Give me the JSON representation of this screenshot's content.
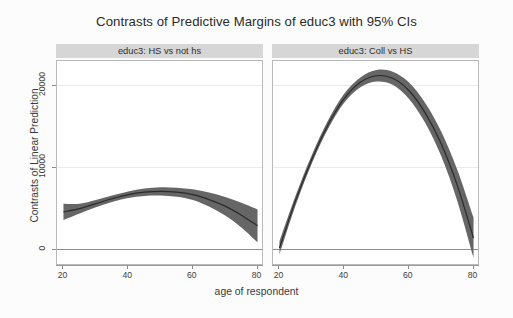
{
  "figure": {
    "title": "Contrasts of Predictive Margins of educ3 with 95% CIs",
    "xaxis_title": "age of respondent",
    "yaxis_title": "Contrasts of Linear Prediction",
    "background": "#fcfcfc",
    "panel_header_bg": "#d6d6d6",
    "plot_bg": "#ffffff",
    "band_color": "#666666",
    "line_color": "#2b2b2b",
    "grid_color": "#eaeaea",
    "zero_line_color": "#8e8e8e"
  },
  "axes": {
    "y_ticks": [
      "0",
      "10000",
      "20000"
    ],
    "y_tick_values": [
      0,
      10000,
      20000
    ],
    "x_ticks": [
      "20",
      "40",
      "60",
      "80"
    ],
    "x_tick_values": [
      20,
      40,
      60,
      80
    ],
    "ylim": [
      -2000,
      23000
    ],
    "xlim": [
      18,
      82
    ],
    "grid": true
  },
  "panels": [
    {
      "label": "educ3: HS vs not hs"
    },
    {
      "label": "educ3: Coll vs HS"
    }
  ],
  "chart_data": {
    "type": "line",
    "title": "Contrasts of Predictive Margins of educ3 with 95% CIs",
    "xlabel": "age of respondent",
    "ylabel": "Contrasts of Linear Prediction",
    "xlim": [
      18,
      82
    ],
    "ylim": [
      -2000,
      23000
    ],
    "grid": true,
    "legend": "none",
    "ci_level": "95%",
    "panels": [
      {
        "name": "educ3: HS vs not hs",
        "x": [
          20,
          25,
          30,
          35,
          40,
          45,
          50,
          55,
          60,
          65,
          70,
          75,
          80
        ],
        "fit": [
          4600,
          5000,
          5600,
          6200,
          6700,
          7000,
          7100,
          7000,
          6700,
          6100,
          5300,
          4200,
          2900
        ],
        "ci_lower": [
          3600,
          4400,
          5150,
          5800,
          6300,
          6550,
          6600,
          6450,
          6050,
          5250,
          4150,
          2700,
          900
        ],
        "ci_upper": [
          5600,
          5600,
          6050,
          6600,
          7100,
          7450,
          7600,
          7550,
          7350,
          6950,
          6400,
          5700,
          4900
        ]
      },
      {
        "name": "educ3: Coll vs HS",
        "x": [
          20,
          25,
          30,
          35,
          40,
          45,
          50,
          55,
          60,
          65,
          70,
          75,
          80
        ],
        "fit": [
          200,
          6000,
          11000,
          15200,
          18400,
          20400,
          21200,
          20900,
          19400,
          16700,
          12900,
          7800,
          1400
        ],
        "ci_lower": [
          -600,
          5400,
          10500,
          14700,
          17900,
          19800,
          20500,
          20100,
          18400,
          15500,
          11400,
          5900,
          -1000
        ],
        "ci_upper": [
          1000,
          6600,
          11550,
          15750,
          19000,
          21000,
          21900,
          21700,
          20400,
          17900,
          14400,
          9700,
          3900
        ]
      }
    ]
  }
}
